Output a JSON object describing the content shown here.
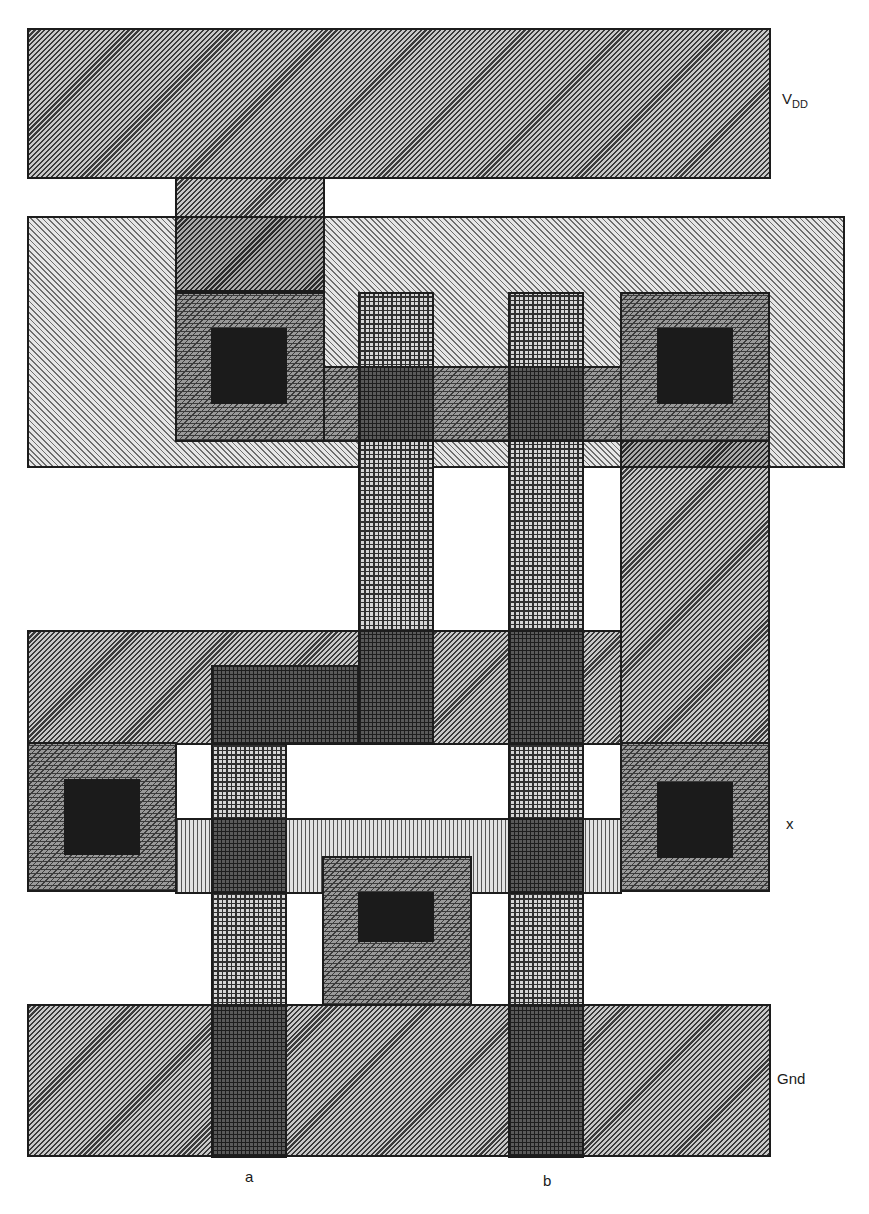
{
  "diagram": {
    "type": "CMOS stick/layout diagram (two-input gate)",
    "labels": {
      "vdd_main": "V",
      "vdd_sub": "DD",
      "output": "x",
      "ground": "Gnd",
      "input_a": "a",
      "input_b": "b"
    },
    "layers": [
      "metal",
      "n-well",
      "polysilicon",
      "p-diffusion",
      "n-diffusion",
      "contact"
    ],
    "colors": {
      "metal": "#8a8a8a",
      "nwell": "#c0c0c0",
      "poly": "#d6d6d6",
      "contact": "#1b1b1b",
      "outline": "#1c1c1c"
    }
  }
}
